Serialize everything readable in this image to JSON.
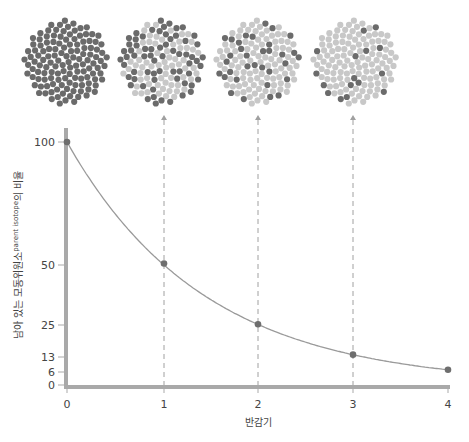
{
  "chart_data": {
    "type": "line",
    "title": "",
    "xlabel": "반감기",
    "ylabel": "남아 있는 모동위원소",
    "ylabel_superscript": "parent isotope",
    "ylabel_suffix": "의 비율",
    "x": [
      0,
      1,
      2,
      3,
      4
    ],
    "values": [
      100,
      50,
      25,
      12.5,
      6.25
    ],
    "series": [
      {
        "name": "remaining parent isotope",
        "values": [
          100,
          50,
          25,
          12.5,
          6.25
        ]
      }
    ],
    "xticks": [
      "0",
      "1",
      "2",
      "3",
      "4"
    ],
    "yticks": [
      "0",
      "6",
      "13",
      "25",
      "50",
      "100"
    ],
    "ylim": [
      0,
      100
    ],
    "xlim": [
      0,
      4
    ],
    "grid": false,
    "legend": null,
    "annotations": [
      {
        "type": "dot-circle",
        "x": 0,
        "parent_fraction": 1.0
      },
      {
        "type": "dot-circle",
        "x": 1,
        "parent_fraction": 0.5
      },
      {
        "type": "dot-circle",
        "x": 2,
        "parent_fraction": 0.25
      },
      {
        "type": "dot-circle",
        "x": 3,
        "parent_fraction": 0.125
      }
    ]
  },
  "colors": {
    "parent": "#6b6b6b",
    "daughter": "#c8c8c8",
    "axis": "#a9a9a9",
    "curve": "#9a9a9a",
    "point": "#6e6e6e",
    "dashed": "#a0a0a0"
  },
  "labels": {
    "xlabel": "반감기",
    "ylabel_main": "남아 있는 모동위원소",
    "ylabel_sup": "parent isotope",
    "ylabel_tail": "의 비율",
    "xticks": [
      "0",
      "1",
      "2",
      "3",
      "4"
    ],
    "yticks": [
      "100",
      "50",
      "25",
      "13",
      "6",
      "0"
    ]
  }
}
